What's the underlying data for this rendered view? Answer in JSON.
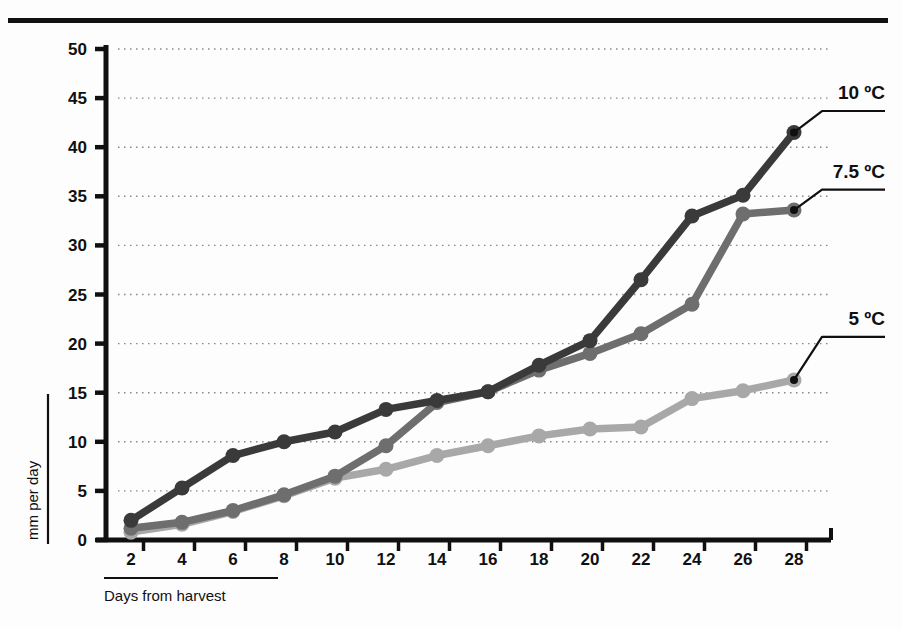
{
  "figure": {
    "top_rule": "horizontal-rule",
    "background": "#fdfdfd"
  },
  "chart_data": {
    "type": "line",
    "title": "",
    "xlabel": "Days from harvest",
    "ylabel": "mm per day",
    "x": [
      2,
      4,
      6,
      8,
      10,
      12,
      14,
      16,
      18,
      20,
      22,
      24,
      26,
      28
    ],
    "xlim": [
      0,
      29
    ],
    "ylim": [
      0,
      50
    ],
    "xticks": [
      2,
      4,
      6,
      8,
      10,
      12,
      14,
      16,
      18,
      20,
      22,
      24,
      26,
      28
    ],
    "yticks": [
      0,
      5,
      10,
      15,
      20,
      25,
      30,
      35,
      40,
      45,
      50
    ],
    "grid": "horizontal-dotted",
    "legend_position": "right-inline-labels",
    "series": [
      {
        "name": "10 ºC",
        "color": "#3a3a3a",
        "label_x": 28,
        "label_y": 44.5,
        "values": [
          2.0,
          5.3,
          8.6,
          10.0,
          11.0,
          13.3,
          14.2,
          15.1,
          17.8,
          20.3,
          26.5,
          33.0,
          35.1,
          41.5
        ]
      },
      {
        "name": "7.5 ºC",
        "color": "#6e6e6e",
        "label_x": 28,
        "label_y": 36.5,
        "values": [
          1.2,
          1.8,
          3.0,
          4.6,
          6.5,
          9.6,
          14.0,
          15.1,
          17.3,
          19.0,
          21.0,
          24.0,
          33.2,
          33.6
        ]
      },
      {
        "name": "5 ºC",
        "color": "#a8a8a8",
        "label_x": 28,
        "label_y": 21.5,
        "values": [
          0.8,
          1.6,
          2.9,
          4.5,
          6.3,
          7.2,
          8.6,
          9.6,
          10.6,
          11.3,
          11.5,
          14.4,
          15.2,
          16.3
        ]
      }
    ]
  }
}
